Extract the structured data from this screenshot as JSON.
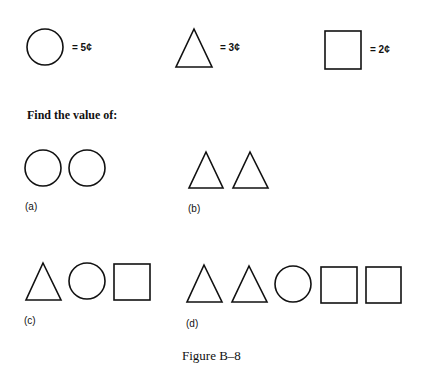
{
  "legend": [
    {
      "shape": "circle",
      "value_text": "= 5¢",
      "cents": 5
    },
    {
      "shape": "triangle",
      "value_text": "= 3¢",
      "cents": 3
    },
    {
      "shape": "square",
      "value_text": "= 2¢",
      "cents": 2
    }
  ],
  "prompt": "Find the value of:",
  "problems": [
    {
      "label": "(a)",
      "shapes": [
        "circle",
        "circle"
      ]
    },
    {
      "label": "(b)",
      "shapes": [
        "triangle",
        "triangle"
      ]
    },
    {
      "label": "(c)",
      "shapes": [
        "triangle",
        "circle",
        "square"
      ]
    },
    {
      "label": "(d)",
      "shapes": [
        "triangle",
        "triangle",
        "circle",
        "square",
        "square"
      ]
    }
  ],
  "caption": "Figure B–8",
  "colors": {
    "stroke": "#111111",
    "background": "#ffffff"
  }
}
